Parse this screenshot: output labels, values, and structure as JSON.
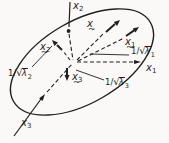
{
  "figure": {
    "type": "math-diagram",
    "ink_color": "#1f1f1f",
    "background_color": "#faf9f7"
  },
  "labels": {
    "axis_x1": {
      "letter": "x",
      "sub": "1"
    },
    "axis_x2": {
      "letter": "x",
      "sub": "2"
    },
    "axis_x3": {
      "letter": "x",
      "sub": "3"
    },
    "vec_x": {
      "letter": "x",
      "accent": "~",
      "sub": ""
    },
    "vec_x1": {
      "letter": "x",
      "accent": "~",
      "sub": "1"
    },
    "vec_x2": {
      "letter": "x",
      "accent": "~",
      "sub": "2"
    },
    "vec_x3": {
      "letter": "x",
      "accent": "~",
      "sub": "3"
    },
    "len1": {
      "prefix": "1/",
      "sqrt": "√",
      "radicand": "λ",
      "sub": "1"
    },
    "len2": {
      "prefix": "1/",
      "sqrt": "√",
      "radicand": "λ",
      "sub": "2"
    },
    "len3": {
      "prefix": "1/",
      "sqrt": "√",
      "radicand": "λ",
      "sub": "3"
    }
  }
}
